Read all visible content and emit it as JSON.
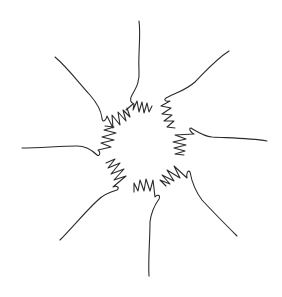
{
  "illustration": {
    "subject": "Eight hands reaching into a circle",
    "stroke_color": "#2b2b2b",
    "background_color": "#ffffff",
    "center": [
      142,
      142
    ],
    "hands": [
      {
        "name": "top",
        "angle": -90
      },
      {
        "name": "top-right",
        "angle": -40
      },
      {
        "name": "right",
        "angle": 5
      },
      {
        "name": "bottom-right",
        "angle": 50
      },
      {
        "name": "bottom",
        "angle": 95
      },
      {
        "name": "bottom-left",
        "angle": 140
      },
      {
        "name": "left",
        "angle": 185
      },
      {
        "name": "top-left",
        "angle": 228
      }
    ]
  }
}
